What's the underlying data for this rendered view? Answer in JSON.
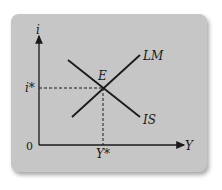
{
  "diagram": {
    "type": "IS-LM model",
    "axes": {
      "y_label": "i",
      "x_label": "Y",
      "origin_label": "0"
    },
    "curves": [
      {
        "name": "LM",
        "label": "LM",
        "slope": "upward"
      },
      {
        "name": "IS",
        "label": "IS",
        "slope": "downward"
      }
    ],
    "equilibrium": {
      "point_label": "E",
      "i_label": "i*",
      "y_label": "Y*"
    }
  },
  "colors": {
    "card": "#c6c6c6",
    "ink": "#1a1a1a"
  }
}
